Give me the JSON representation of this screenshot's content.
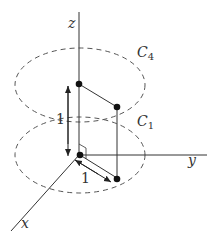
{
  "diagram": {
    "axes": {
      "z_label": "z",
      "y_label": "y",
      "x_label": "x"
    },
    "curves": {
      "upper_label_main": "C",
      "upper_label_sub": "4",
      "lower_label_main": "C",
      "lower_label_sub": "1"
    },
    "dimensions": {
      "vertical_label": "1",
      "radial_label": "1"
    },
    "colors": {
      "stroke": "#333333",
      "dashed": "#555555",
      "point": "#111111"
    }
  }
}
